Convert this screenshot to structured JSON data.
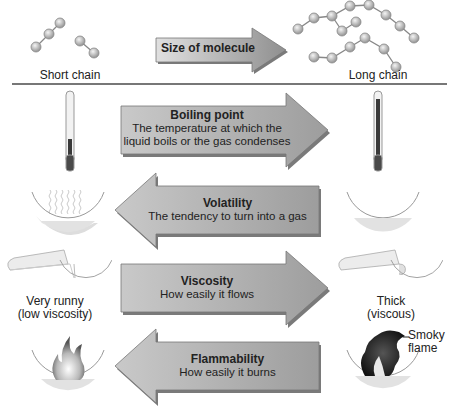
{
  "top": {
    "left_label": "Short chain",
    "right_label": "Long chain",
    "arrow_label": "Size of molecule"
  },
  "properties": [
    {
      "title": "Boiling point",
      "desc_line1": "The temperature at which the",
      "desc_line2": "liquid boils or the gas condenses",
      "direction": "right"
    },
    {
      "title": "Volatility",
      "desc_line1": "The tendency to turn into a gas",
      "direction": "left"
    },
    {
      "title": "Viscosity",
      "desc_line1": "How easily it flows",
      "direction": "right"
    },
    {
      "title": "Flammability",
      "desc_line1": "How easily it burns",
      "direction": "left"
    }
  ],
  "viscosity_labels": {
    "left_line1": "Very runny",
    "left_line2": "(low viscosity)",
    "right_line1": "Thick",
    "right_line2": "(viscous)"
  },
  "flame_labels": {
    "right_line1": "Smoky",
    "right_line2": "flame"
  },
  "colors": {
    "arrow_fill": "#a9a9a9",
    "arrow_light": "#d4d4d4",
    "arrow_shadow": "#7a7a7a",
    "molecule_atom": "#c8c8c8",
    "divider": "#777777"
  }
}
